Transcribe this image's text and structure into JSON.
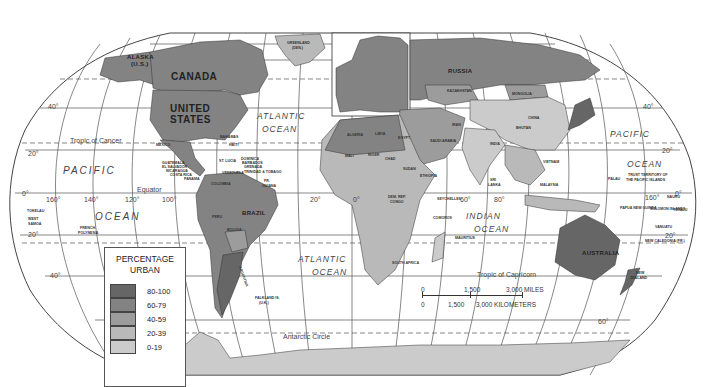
{
  "map": {
    "projection": "Robinson",
    "legend": {
      "title_line1": "PERCENTAGE",
      "title_line2": "URBAN",
      "classes": [
        {
          "range": "80-100",
          "color": "#666666"
        },
        {
          "range": "60-79",
          "color": "#838383"
        },
        {
          "range": "40-59",
          "color": "#9c9c9c"
        },
        {
          "range": "20-39",
          "color": "#b9b9b9"
        },
        {
          "range": "0-19",
          "color": "#cbcbcb"
        }
      ]
    },
    "scale_bar": {
      "miles": [
        "0",
        "1,500",
        "3,000 MILES"
      ],
      "kilometers": [
        "0",
        "1,500",
        "3,000 KILOMETERS"
      ]
    },
    "lines": {
      "tropic_cancer": "Tropic of Cancer",
      "equator": "Equator",
      "tropic_capricorn": "Tropic of Capricorn",
      "antarctic_circle": "Antarctic Circle"
    },
    "degrees": {
      "lat_40n_w": "40°",
      "lat_20n_w": "20°",
      "lat_0_w": "0°",
      "lat_20s_w": "20°",
      "lat_40s_w": "40°",
      "lat_40n_e": "40°",
      "lat_20n_e": "20°",
      "lat_0_e": "0°",
      "lat_20s_e": "20°",
      "lat_60s_e": "60°",
      "lon_160w": "160°",
      "lon_140w": "140°",
      "lon_120w": "120°",
      "lon_100w": "100°",
      "lon_20w": "20°",
      "lon_0": "0°",
      "lon_60e": "60°",
      "lon_80e": "80°",
      "lon_160e": "160°"
    },
    "oceans": {
      "pacific_w_1": "PACIFIC",
      "pacific_w_2": "OCEAN",
      "atlantic_n_1": "ATLANTIC",
      "atlantic_n_2": "OCEAN",
      "atlantic_s_1": "ATLANTIC",
      "atlantic_s_2": "OCEAN",
      "indian_1": "INDIAN",
      "indian_2": "OCEAN",
      "pacific_e_1": "PACIFIC",
      "pacific_e_2": "OCEAN"
    },
    "countries": {
      "canada": "CANADA",
      "united_states_1": "UNITED",
      "united_states_2": "STATES",
      "alaska_1": "ALASKA",
      "alaska_2": "(U.S.)",
      "greenland_1": "GREENLAND",
      "greenland_2": "(DEN.)",
      "mexico": "MEXICO",
      "brazil": "BRAZIL",
      "bolivia": "BOLIVIA",
      "argentina": "ARGENTINA",
      "russia": "RUSSIA",
      "kazakhstan": "KAZAKHSTAN",
      "mongolia": "MONGOLIA",
      "china": "CHINA",
      "india": "INDIA",
      "iran": "IRAN",
      "algeria": "ALGERIA",
      "libya": "LIBYA",
      "egypt": "EGYPT",
      "saudi_arabia": "SAUDI ARABIA",
      "mali": "MALI",
      "niger": "NIGER",
      "chad": "CHAD",
      "sudan": "SUDAN",
      "ethiopia": "ETHIOPIA",
      "dem_rep_congo_1": "DEM. REP.",
      "dem_rep_congo_2": "CONGO",
      "australia": "AUSTRALIA",
      "new_zealand_1": "NEW",
      "new_zealand_2": "ZEALAND",
      "sri_lanka_1": "SRI",
      "sri_lanka_2": "LANKA",
      "malaysia": "MALAYSIA",
      "papua_new_guinea": "PAPUA NEW GUINEA",
      "solomon_islands": "SOLOMON ISLANDS",
      "vanuatu": "VANUATU",
      "new_caledonia": "NEW CALEDONIA (FR.)",
      "nauru": "NAURU",
      "tuvalu": "TUVALU",
      "palau": "PALAU",
      "trust_territory_1": "TRUST TERRITORY OF",
      "trust_territory_2": "THE PACIFIC ISLANDS",
      "tokelau": "TOKELAU",
      "west_samoa_1": "WEST",
      "west_samoa_2": "SAMOA",
      "french_polynesia_1": "FRENCH",
      "french_polynesia_2": "POLYNESIA",
      "falkland_1": "FALKLAND IS.",
      "falkland_2": "(U.K.)",
      "seychelles": "SEYCHELLES",
      "comoros": "COMOROS",
      "mauritius": "MAURITIUS",
      "bahamas": "BAHAMAS",
      "haiti": "HAITI",
      "guatemala": "GUATEMALA",
      "el_salvador": "EL SALVADOR",
      "nicaragua": "NICARAGUA",
      "costa_rica": "COSTA RICA",
      "panama": "PANAMA",
      "st_lucia": "ST. LUCIA",
      "dominica": "DOMINICA",
      "barbados": "BARBADOS",
      "grenada": "GRENADA",
      "trinidad": "TRINIDAD & TOBAGO",
      "venezuela": "VENEZUELA",
      "colombia": "COLOMBIA",
      "guiana_1": "FR.",
      "guiana_2": "GUIANA",
      "peru": "PERU",
      "south_africa": "SOUTH AFRICA",
      "vietnam": "VIETNAM",
      "bhutan": "BHUTAN"
    }
  }
}
